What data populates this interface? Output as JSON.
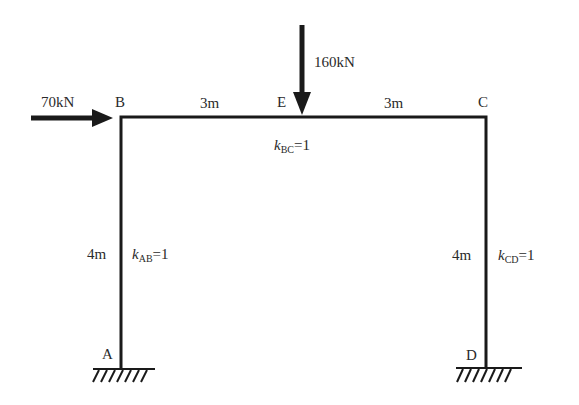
{
  "diagram": {
    "type": "portal frame",
    "nodes": {
      "A": "A",
      "B": "B",
      "C": "C",
      "D": "D",
      "E": "E"
    },
    "loads": {
      "horizontal": "70kN",
      "vertical": "160kN"
    },
    "dimensions": {
      "BE": "3m",
      "EC": "3m",
      "AB": "4m",
      "CD": "4m"
    },
    "stiffness": {
      "AB": {
        "symbol": "k",
        "sub": "AB",
        "value": "=1"
      },
      "BC": {
        "symbol": "k",
        "sub": "BC",
        "value": "=1"
      },
      "CD": {
        "symbol": "k",
        "sub": "CD",
        "value": "=1"
      }
    },
    "supports": {
      "A": "fixed",
      "D": "fixed"
    }
  }
}
